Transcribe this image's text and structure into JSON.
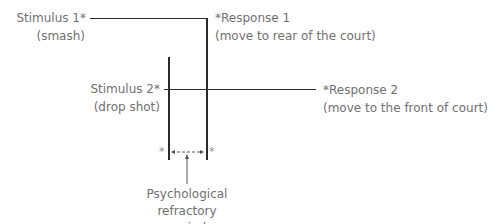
{
  "diagram": {
    "stimulus_1": {
      "label": "Stimulus 1*",
      "detail": "(smash)"
    },
    "response_1": {
      "label": "*Response 1",
      "detail": "(move to rear of the court)"
    },
    "stimulus_2": {
      "label": "Stimulus 2*",
      "detail": "(drop shot)"
    },
    "response_2": {
      "label": "*Response 2",
      "detail": "(move to the front of court)"
    },
    "interval_marker": "*",
    "prp_label": [
      "Psychological",
      "refractory",
      "period"
    ],
    "colors": {
      "lines": "#2a2a2a",
      "text": "#707070"
    }
  }
}
